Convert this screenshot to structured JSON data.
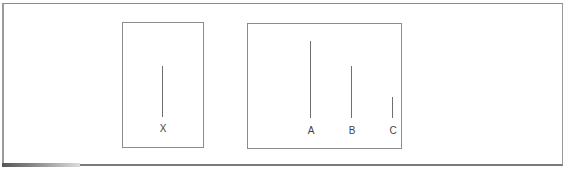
{
  "diagram": {
    "standard_card": {
      "lines": [
        {
          "label": "X",
          "length_px": 51
        }
      ]
    },
    "comparison_card": {
      "lines": [
        {
          "label": "A",
          "length_px": 77
        },
        {
          "label": "B",
          "length_px": 52
        },
        {
          "label": "C",
          "length_px": 21
        }
      ]
    },
    "colors": {
      "line": "#6f6f6f",
      "border": "#8c8c8c",
      "background": "#ffffff"
    }
  }
}
